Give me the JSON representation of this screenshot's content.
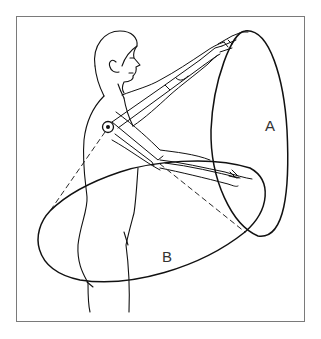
{
  "figure": {
    "labels": {
      "a": "A",
      "b": "B"
    },
    "colors": {
      "background": "#ffffff",
      "line": "#111111",
      "frame": "#7a7a7a"
    }
  }
}
